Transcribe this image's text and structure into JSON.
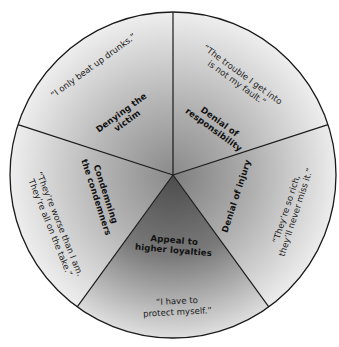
{
  "diagram": {
    "type": "wheel",
    "center": [
      173,
      175
    ],
    "radius": 163,
    "colors": {
      "rim": "#1a1a1a",
      "slice_center": "#8c8c8c",
      "slice_edge": "#ededed",
      "highlight_center": "#4f4f4f",
      "highlight_edge": "#dcdcdc"
    },
    "slices": [
      {
        "id": "denial-of-responsibility",
        "label_line1": "Denial of",
        "label_line2": "responsibility",
        "quote_line1": "“The trouble I get into",
        "quote_line2": "is not my fault.”"
      },
      {
        "id": "denial-of-injury",
        "label_line1": "Denial of injury",
        "quote_line1": "“They’re so rich,",
        "quote_line2": "they’ll never miss it.”"
      },
      {
        "id": "appeal-to-higher-loyalties",
        "label_line1": "Appeal to",
        "label_line2": "higher loyalties",
        "quote_line1": "“I have to",
        "quote_line2": "protect myself.”"
      },
      {
        "id": "condemning-the-condemners",
        "label_line1": "Condemning",
        "label_line2": "the condemners",
        "quote_line1": "“They’re worse than I am.",
        "quote_line2": "They’re all on the take.”"
      },
      {
        "id": "denying-the-victim",
        "label_line1": "Denying the",
        "label_line2": "victim",
        "quote_line1": "“I only beat up drunks.”"
      }
    ]
  }
}
